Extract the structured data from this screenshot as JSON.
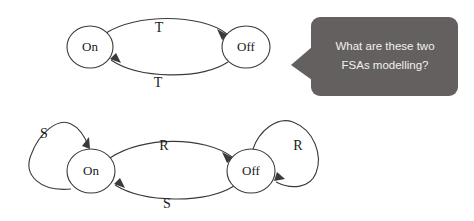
{
  "diagram": {
    "title_visible": false,
    "background_color": "#ffffff",
    "stroke_color": "#3a3a3a",
    "text_color": "#1a1a1a"
  },
  "fsa_top": {
    "name": "top-fsa",
    "states": [
      {
        "id": "on",
        "label": "On",
        "cx": 90,
        "cy": 47,
        "rx": 23,
        "ry": 21
      },
      {
        "id": "off",
        "label": "Off",
        "cx": 246,
        "cy": 47,
        "rx": 24,
        "ry": 21
      }
    ],
    "transitions": [
      {
        "id": "on-to-off",
        "label": "T",
        "from": "On",
        "to": "Off",
        "label_x": 159,
        "label_y": 29
      },
      {
        "id": "off-to-on",
        "label": "T",
        "from": "Off",
        "to": "On",
        "label_x": 158,
        "label_y": 84
      }
    ]
  },
  "fsa_bottom": {
    "name": "bottom-fsa",
    "states": [
      {
        "id": "on",
        "label": "On",
        "cx": 91,
        "cy": 171,
        "rx": 24,
        "ry": 22
      },
      {
        "id": "off",
        "label": "Off",
        "cx": 251,
        "cy": 171,
        "rx": 24,
        "ry": 22
      }
    ],
    "transitions": [
      {
        "id": "on-self-loop",
        "label": "S",
        "from": "On",
        "to": "On",
        "label_x": 44,
        "label_y": 135
      },
      {
        "id": "on-to-off",
        "label": "R",
        "from": "On",
        "to": "Off",
        "label_x": 164,
        "label_y": 147
      },
      {
        "id": "off-to-on",
        "label": "S",
        "from": "Off",
        "to": "On",
        "label_x": 167,
        "label_y": 205
      },
      {
        "id": "off-self-loop",
        "label": "R",
        "from": "Off",
        "to": "Off",
        "label_x": 298,
        "label_y": 147
      }
    ]
  },
  "speech_bubble": {
    "name": "speech-bubble",
    "background_color": "#63605f",
    "text_color": "#f2f1ef",
    "lines": [
      "What are these two",
      "FSAs modelling?"
    ],
    "full_text": "What are these two FSAs modelling?",
    "tail_direction": "left"
  }
}
